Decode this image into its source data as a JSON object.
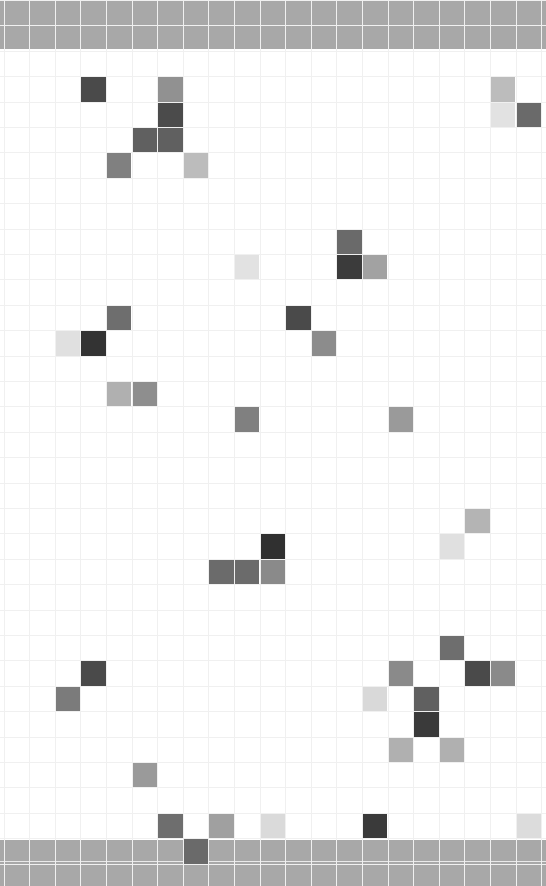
{
  "canvas": {
    "title": "Grid Canvas",
    "width": 546,
    "height": 886,
    "background_color": "#ffffff",
    "grid_line_color": "#f0f0f0",
    "cell_width": 25.6,
    "cell_height": 25.4,
    "origin_x": 3.5,
    "origin_y": 0,
    "columns": 22,
    "rows": 35
  },
  "bands": [
    {
      "name": "header-band",
      "label": "header band",
      "top": 0,
      "height": 49,
      "color": "#a8a8a8",
      "row_divider_y": 25
    },
    {
      "name": "footer-band",
      "label": "footer band",
      "top": 840,
      "height": 46,
      "color": "#a8a8a8",
      "row_divider_y": 21
    }
  ],
  "palette": {
    "near_black": "#333333",
    "very_dark": "#3c3c3c",
    "dark": "#4a4a4a",
    "dark_mid": "#555555",
    "mid_dark": "#606060",
    "mid": "#6e6e6e",
    "mid_light": "#808080",
    "gray": "#909090",
    "light_gray": "#a8a8a8",
    "lighter_gray": "#bcbcbc",
    "pale": "#d4d4d4",
    "paler": "#e0e0e0",
    "palest": "#e8e8e8",
    "band_gray": "#a8a8a8"
  },
  "cells": [
    {
      "col": 3,
      "row": 3,
      "color": "#4a4a4a"
    },
    {
      "col": 6,
      "row": 3,
      "color": "#919191"
    },
    {
      "col": 6,
      "row": 4,
      "color": "#4b4b4b"
    },
    {
      "col": 5,
      "row": 5,
      "color": "#606060"
    },
    {
      "col": 6,
      "row": 5,
      "color": "#606060"
    },
    {
      "col": 4,
      "row": 6,
      "color": "#808080"
    },
    {
      "col": 7,
      "row": 6,
      "color": "#bcbcbc"
    },
    {
      "col": 19,
      "row": 3,
      "color": "#bcbcbc"
    },
    {
      "col": 19,
      "row": 4,
      "color": "#e2e2e2"
    },
    {
      "col": 20,
      "row": 4,
      "color": "#6a6a6a"
    },
    {
      "col": 13,
      "row": 9,
      "color": "#6a6a6a"
    },
    {
      "col": 9,
      "row": 10,
      "color": "#e2e2e2"
    },
    {
      "col": 13,
      "row": 10,
      "color": "#3b3b3b"
    },
    {
      "col": 14,
      "row": 10,
      "color": "#a2a2a2"
    },
    {
      "col": 4,
      "row": 12,
      "color": "#6e6e6e"
    },
    {
      "col": 11,
      "row": 12,
      "color": "#4a4a4a"
    },
    {
      "col": 2,
      "row": 13,
      "color": "#e0e0e0"
    },
    {
      "col": 3,
      "row": 13,
      "color": "#333333"
    },
    {
      "col": 12,
      "row": 13,
      "color": "#8c8c8c"
    },
    {
      "col": 4,
      "row": 15,
      "color": "#b0b0b0"
    },
    {
      "col": 5,
      "row": 15,
      "color": "#8e8e8e"
    },
    {
      "col": 9,
      "row": 16,
      "color": "#808080"
    },
    {
      "col": 15,
      "row": 16,
      "color": "#9a9a9a"
    },
    {
      "col": 18,
      "row": 20,
      "color": "#b4b4b4"
    },
    {
      "col": 10,
      "row": 21,
      "color": "#303030"
    },
    {
      "col": 17,
      "row": 21,
      "color": "#e0e0e0"
    },
    {
      "col": 8,
      "row": 22,
      "color": "#6b6b6b"
    },
    {
      "col": 9,
      "row": 22,
      "color": "#6b6b6b"
    },
    {
      "col": 10,
      "row": 22,
      "color": "#8a8a8a"
    },
    {
      "col": 17,
      "row": 25,
      "color": "#6e6e6e"
    },
    {
      "col": 3,
      "row": 26,
      "color": "#4a4a4a"
    },
    {
      "col": 15,
      "row": 26,
      "color": "#8a8a8a"
    },
    {
      "col": 18,
      "row": 26,
      "color": "#4a4a4a"
    },
    {
      "col": 19,
      "row": 26,
      "color": "#8a8a8a"
    },
    {
      "col": 2,
      "row": 27,
      "color": "#7b7b7b"
    },
    {
      "col": 14,
      "row": 27,
      "color": "#d9d9d9"
    },
    {
      "col": 16,
      "row": 27,
      "color": "#606060"
    },
    {
      "col": 16,
      "row": 28,
      "color": "#3a3a3a"
    },
    {
      "col": 15,
      "row": 29,
      "color": "#b0b0b0"
    },
    {
      "col": 17,
      "row": 29,
      "color": "#b0b0b0"
    },
    {
      "col": 5,
      "row": 30,
      "color": "#9a9a9a"
    },
    {
      "col": 6,
      "row": 32,
      "color": "#6e6e6e"
    },
    {
      "col": 8,
      "row": 32,
      "color": "#a0a0a0"
    },
    {
      "col": 10,
      "row": 32,
      "color": "#dadada"
    },
    {
      "col": 14,
      "row": 32,
      "color": "#3a3a3a"
    },
    {
      "col": 20,
      "row": 32,
      "color": "#dcdcdc"
    },
    {
      "col": 7,
      "row": 33,
      "color": "#6a6a6a"
    }
  ]
}
